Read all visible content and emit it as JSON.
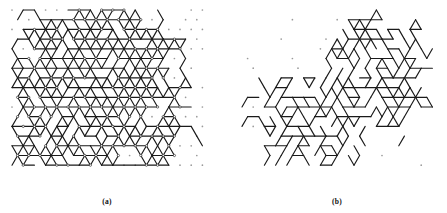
{
  "figure": {
    "width": 447,
    "height": 213,
    "background_color": "#ffffff",
    "line_color": "#1a1a1a",
    "dot_color": "#9a9a9a",
    "node_fill_color": "#ffffff"
  },
  "panels": [
    {
      "id": "a",
      "caption": "(a)",
      "caption_x": 107,
      "caption_y": 197,
      "x": 8,
      "y": 4,
      "width": 196,
      "height": 184,
      "description": "dense percolation cluster configuration on triangular lattice",
      "lattice": {
        "type": "triangular",
        "spacing": 11.2,
        "rows": 17,
        "cols": 19,
        "origin_x": 4,
        "origin_y": 6
      },
      "bond_count": 268,
      "dot_count": 196,
      "stroke_width": 1.15,
      "dot_radius": 0.85,
      "node_radius": 1.15,
      "occupied_fraction": 0.62,
      "style": "dense",
      "seed": 20412
    },
    {
      "id": "b",
      "caption": "(b)",
      "caption_x": 337,
      "caption_y": 197,
      "x": 238,
      "y": 4,
      "width": 196,
      "height": 184,
      "description": "sparse percolation cluster configuration on triangular lattice",
      "lattice": {
        "type": "triangular",
        "spacing": 11.2,
        "rows": 17,
        "cols": 19,
        "origin_x": 4,
        "origin_y": 6
      },
      "bond_count": 132,
      "dot_count": 46,
      "stroke_width": 1.15,
      "dot_radius": 0.85,
      "node_radius": 1.15,
      "occupied_fraction": 0.31,
      "style": "sparse",
      "seed": 77310
    }
  ],
  "chart_data": {
    "type": "diagram",
    "title": "",
    "subtitle": "",
    "panel_labels": [
      "(a)",
      "(b)"
    ],
    "lattice_type": "triangular",
    "panel_a_density": 0.62,
    "panel_b_density": 0.31
  }
}
